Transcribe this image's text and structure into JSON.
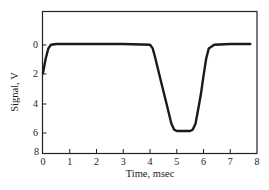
{
  "chart_data": {
    "type": "line",
    "title": "",
    "xlabel": "Time, msec",
    "ylabel": "Signal, V",
    "xlim": [
      0,
      8
    ],
    "ylim": [
      8,
      -2
    ],
    "y_inverted": true,
    "grid": false,
    "legend": null,
    "x_ticks": [
      "0",
      "1",
      "2",
      "3",
      "4",
      "5",
      "6",
      "7",
      "8"
    ],
    "y_ticks": [
      "0",
      "2",
      "4",
      "6",
      "8"
    ],
    "series": [
      {
        "name": "Signal",
        "color": "#1a1a1a",
        "x": [
          0.0,
          0.1,
          0.2,
          0.3,
          0.5,
          1.0,
          2.0,
          3.0,
          4.0,
          4.1,
          4.2,
          4.4,
          4.6,
          4.8,
          4.9,
          5.0,
          5.5,
          5.6,
          5.7,
          5.8,
          5.9,
          6.0,
          6.1,
          6.2,
          6.4,
          7.0,
          7.75
        ],
        "values": [
          2.0,
          1.0,
          0.3,
          0.05,
          0.0,
          0.0,
          0.0,
          0.0,
          0.05,
          0.3,
          1.0,
          2.5,
          4.0,
          5.5,
          5.9,
          6.0,
          6.0,
          5.9,
          5.5,
          4.5,
          3.5,
          2.2,
          1.0,
          0.3,
          0.05,
          0.0,
          0.0
        ]
      }
    ]
  },
  "axes": {
    "xlabel": "Time, msec",
    "ylabel": "Signal, V",
    "x_tick_labels": [
      "0",
      "1",
      "2",
      "3",
      "4",
      "5",
      "6",
      "7",
      "8"
    ],
    "y_tick_labels": [
      "0",
      "2",
      "4",
      "6",
      "8"
    ]
  }
}
